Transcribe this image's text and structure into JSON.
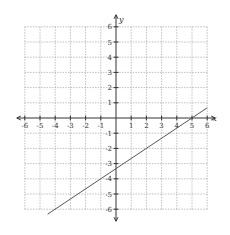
{
  "chart_data": {
    "type": "line",
    "title": "",
    "xlabel": "x",
    "ylabel": "y",
    "xlim": [
      -6,
      6
    ],
    "ylim": [
      -6,
      6
    ],
    "grid": true,
    "x_ticks": [
      -6,
      -5,
      -4,
      -3,
      -2,
      -1,
      1,
      2,
      3,
      4,
      5,
      6
    ],
    "y_ticks": [
      -6,
      -5,
      -4,
      -3,
      -2,
      -1,
      1,
      2,
      3,
      4,
      5,
      6
    ],
    "series": [
      {
        "name": "line",
        "equation": "y = (2/3)x - 10/3",
        "x": [
          -4.5,
          6
        ],
        "y": [
          -6.33,
          0.67
        ]
      }
    ],
    "key_points": [
      {
        "x": 5,
        "y": 0
      },
      {
        "x": 2,
        "y": -2
      },
      {
        "x": -4,
        "y": -6
      }
    ]
  },
  "layout": {
    "origin_px": [
      116,
      118
    ],
    "unit_px": 15.2
  }
}
